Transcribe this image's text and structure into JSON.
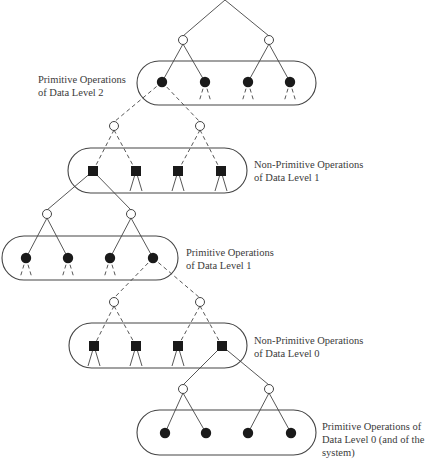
{
  "diagram": {
    "type": "hierarchical operation tree",
    "colors": {
      "stroke": "#444444",
      "fill_dark": "#1a1a1a",
      "text": "#3a3a3a",
      "background": "#ffffff"
    },
    "apex": {
      "x": 225,
      "y": 0
    },
    "groups": [
      {
        "id": "primitive-dl2",
        "kind": "primitive",
        "node_shape": "filled-circle",
        "box": {
          "x": 137,
          "y": 61,
          "w": 179,
          "h": 44
        },
        "nodes_x": [
          162,
          205,
          248,
          290
        ],
        "nodes_y": 82,
        "parents": [
          {
            "x": 183,
            "y": 40
          },
          {
            "x": 269,
            "y": 40
          }
        ],
        "parent_edge_style": "solid",
        "child_edge_style": "dashed",
        "expanded_node_index": 0,
        "label_lines": [
          "Primitive Operations",
          "of Data Level 2"
        ],
        "label_pos": {
          "x": 38,
          "y": 73
        }
      },
      {
        "id": "nonprimitive-dl1",
        "kind": "non-primitive",
        "node_shape": "filled-square",
        "box": {
          "x": 68,
          "y": 148,
          "w": 179,
          "h": 45
        },
        "nodes_x": [
          93,
          136,
          178,
          221
        ],
        "nodes_y": 171,
        "parents": [
          {
            "x": 114,
            "y": 126
          },
          {
            "x": 200,
            "y": 126
          }
        ],
        "parent_edge_style": "dashed",
        "child_edge_style": "solid",
        "expanded_node_index": 0,
        "label_lines": [
          "Non-Primitive Operations",
          "of Data Level 1"
        ],
        "label_pos": {
          "x": 254,
          "y": 158
        }
      },
      {
        "id": "primitive-dl1",
        "kind": "primitive",
        "node_shape": "filled-circle",
        "box": {
          "x": 2,
          "y": 236,
          "w": 176,
          "h": 44
        },
        "nodes_x": [
          26,
          68,
          110,
          153
        ],
        "nodes_y": 258,
        "parents": [
          {
            "x": 47,
            "y": 214
          },
          {
            "x": 131,
            "y": 214
          }
        ],
        "parent_edge_style": "solid",
        "child_edge_style": "dashed",
        "expanded_node_index": 3,
        "label_lines": [
          "Primitive Operations",
          "of Data Level 1"
        ],
        "label_pos": {
          "x": 186,
          "y": 246
        }
      },
      {
        "id": "nonprimitive-dl0",
        "kind": "non-primitive",
        "node_shape": "filled-square",
        "box": {
          "x": 69,
          "y": 323,
          "w": 178,
          "h": 45
        },
        "nodes_x": [
          94,
          136,
          178,
          222
        ],
        "nodes_y": 346,
        "parents": [
          {
            "x": 114,
            "y": 302
          },
          {
            "x": 200,
            "y": 302
          }
        ],
        "parent_edge_style": "dashed",
        "child_edge_style": "solid",
        "expanded_node_index": 3,
        "label_lines": [
          "Non-Primitive Operations",
          "of Data Level 0"
        ],
        "label_pos": {
          "x": 254,
          "y": 334
        }
      },
      {
        "id": "primitive-dl0",
        "kind": "primitive",
        "node_shape": "filled-circle",
        "box": {
          "x": 137,
          "y": 410,
          "w": 179,
          "h": 45
        },
        "nodes_x": [
          165,
          206,
          248,
          291
        ],
        "nodes_y": 433,
        "parents": [
          {
            "x": 183,
            "y": 389
          },
          {
            "x": 269,
            "y": 389
          }
        ],
        "parent_edge_style": "solid",
        "child_edge_style": "none",
        "expanded_node_index": -1,
        "label_lines": [
          "Primitive Operations of",
          "Data Level 0 (and of the",
          "system)"
        ],
        "label_pos": {
          "x": 322,
          "y": 420
        }
      }
    ]
  }
}
